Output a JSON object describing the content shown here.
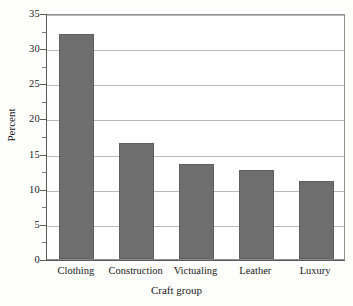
{
  "chart_data": {
    "type": "bar",
    "title": "",
    "subtitle": "",
    "xlabel": "Craft group",
    "ylabel": "Percent",
    "categories": [
      "Clothing",
      "Construction",
      "Victualing",
      "Leather",
      "Luxury"
    ],
    "values": [
      32.0,
      16.5,
      13.5,
      12.7,
      11.1
    ],
    "series": [
      {
        "name": "Percent",
        "values": [
          32.0,
          16.5,
          13.5,
          12.7,
          11.1
        ]
      }
    ],
    "ylim": [
      0,
      35
    ],
    "ytick_labels": [
      "0",
      "5",
      "10",
      "15",
      "20",
      "25",
      "30",
      "35"
    ],
    "ytick_values": [
      0,
      5,
      10,
      15,
      20,
      25,
      30,
      35
    ],
    "yminor_values": [
      2.5,
      7.5,
      12.5,
      17.5,
      22.5,
      27.5,
      32.5
    ],
    "grid": "horizontal",
    "legend": "none",
    "annotations": [],
    "colors": {
      "bar_fill": "#6e6e6e",
      "bar_edge": "#5e5e5e",
      "gridline": "#b9b9b9",
      "axis": "#5a5a5a",
      "frame": "#8f8f8f",
      "plot_background": "#ffffff",
      "figure_background": "#fdfdfb",
      "text": "#1a1a1a"
    }
  }
}
